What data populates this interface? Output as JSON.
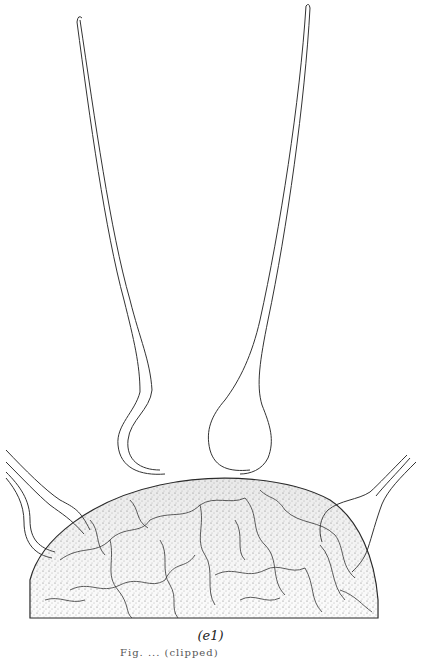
{
  "figure": {
    "panel_label": "(e1)",
    "caption_partial": "Fig. ... (clipped)",
    "colors": {
      "ink": "#222222",
      "background": "#ffffff"
    }
  }
}
